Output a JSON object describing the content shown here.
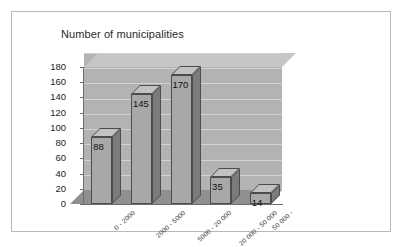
{
  "chart_data": {
    "type": "bar",
    "title": "Number of municipalities",
    "xlabel": "",
    "ylabel": "",
    "ylim": [
      0,
      180
    ],
    "ytick_step": 20,
    "yticks": [
      180,
      160,
      140,
      120,
      100,
      80,
      60,
      40,
      20,
      0
    ],
    "grid": true,
    "legend": "none",
    "style": "3d-column",
    "categories": [
      "0 - 2000",
      "2000 - 5000",
      "5000 - 20 000",
      "20 000 - 50 000",
      "50 000 -"
    ],
    "values": [
      88,
      145,
      170,
      35,
      14
    ],
    "data_labels": [
      "88",
      "145",
      "170",
      "35",
      "14"
    ],
    "colors": {
      "bar_front": "#a8a8a8",
      "bar_top": "#c2c2c2",
      "bar_side": "#7b7b7b",
      "bar_outline": "#4c4c4c",
      "back_wall": "#b3b3b3",
      "ceiling": "#c6c6c6",
      "floor": "#8f8f8f",
      "gridline": "#d2d2d2",
      "axis": "#6d6d6d",
      "frame": "#b9b9b9",
      "background": "#ffffff",
      "text": "#2a2a2a"
    }
  }
}
